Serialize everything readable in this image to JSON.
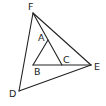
{
  "diagram": {
    "type": "geometry",
    "points": {
      "F": {
        "x": 33,
        "y": 13,
        "label": "F",
        "lx": 28,
        "ly": 10
      },
      "A": {
        "x": 48,
        "y": 40,
        "label": "A",
        "lx": 38,
        "ly": 41
      },
      "B": {
        "x": 33,
        "y": 65,
        "label": "B",
        "lx": 34,
        "ly": 75
      },
      "C": {
        "x": 62,
        "y": 65,
        "label": "C",
        "lx": 63,
        "ly": 63
      },
      "E": {
        "x": 91,
        "y": 65,
        "label": "E",
        "lx": 94,
        "ly": 70
      },
      "D": {
        "x": 19,
        "y": 91,
        "label": "D",
        "lx": 9,
        "ly": 97
      }
    },
    "segments": [
      [
        "F",
        "D"
      ],
      [
        "F",
        "E"
      ],
      [
        "D",
        "E"
      ],
      [
        "F",
        "C"
      ],
      [
        "A",
        "B"
      ],
      [
        "B",
        "E"
      ]
    ],
    "color": "#222222"
  }
}
